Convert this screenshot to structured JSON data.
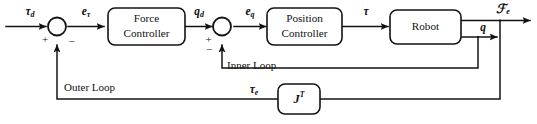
{
  "diagram": {
    "type": "control-block-diagram",
    "background_color": "#ffffff",
    "line_color": "#131313",
    "blocks": [
      {
        "id": "force-controller",
        "label_line1": "Force",
        "label_line2": "Controller"
      },
      {
        "id": "position-controller",
        "label_line1": "Position",
        "label_line2": "Controller"
      },
      {
        "id": "robot",
        "label_line1": "Robot",
        "label_line2": ""
      },
      {
        "id": "jacobian-transpose",
        "label_main": "J",
        "label_sup": "T"
      }
    ],
    "summing_junctions": [
      {
        "id": "outer-sum",
        "plus": "+",
        "minus": "−"
      },
      {
        "id": "inner-sum",
        "plus": "+",
        "minus": "−"
      }
    ],
    "signals": {
      "tau_d": {
        "base": "τ",
        "sub": "d"
      },
      "e_tau": {
        "base": "e",
        "sub": "τ"
      },
      "q_d": {
        "base": "q",
        "sub": "d"
      },
      "e_q": {
        "base": "e",
        "sub": "q"
      },
      "tau": {
        "base": "τ",
        "sub": ""
      },
      "F_e": {
        "base": "ℱ",
        "sub": "e"
      },
      "q": {
        "base": "q",
        "sub": ""
      },
      "tau_e": {
        "base": "τ",
        "sub": "e"
      }
    },
    "loop_labels": {
      "inner": "Inner Loop",
      "outer": "Outer Loop"
    }
  }
}
